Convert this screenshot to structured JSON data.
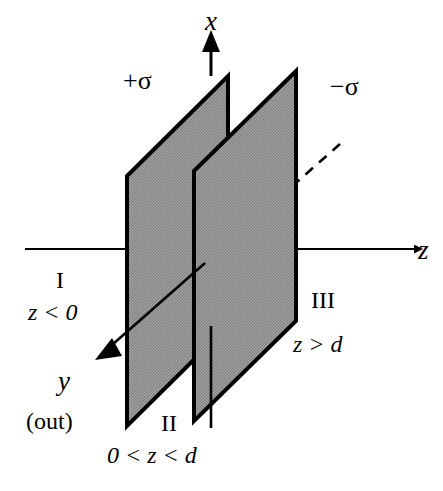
{
  "figure": {
    "background_color": "#ffffff",
    "line_color": "#000000",
    "plane_fill_color": "#999999",
    "width": 443,
    "height": 491
  },
  "axes": {
    "x": {
      "label": "x",
      "direction": "up",
      "label_x": 205,
      "label_y": 8
    },
    "y": {
      "label": "y",
      "direction": "down-left-out-of-page",
      "label_x": 58,
      "label_y": 368
    },
    "z": {
      "label": "z",
      "direction": "right",
      "label_x": 418,
      "label_y": 237
    },
    "y_note": "(out)"
  },
  "planes": [
    {
      "id": "plane-positive",
      "charge_label": "+σ",
      "charge_sign": "positive",
      "position": "z = 0",
      "label_x": 123,
      "label_y": 68
    },
    {
      "id": "plane-negative",
      "charge_label": "−σ",
      "charge_sign": "negative",
      "position": "z = d",
      "label_x": 330,
      "label_y": 74
    }
  ],
  "regions": [
    {
      "id": "region-I",
      "numeral": "I",
      "condition": "z < 0",
      "numeral_x": 56,
      "numeral_y": 268,
      "condition_x": 28,
      "condition_y": 300
    },
    {
      "id": "region-II",
      "numeral": "II",
      "condition": "0 < z < d",
      "numeral_x": 161,
      "numeral_y": 411,
      "condition_x": 107,
      "condition_y": 443
    },
    {
      "id": "region-III",
      "numeral": "III",
      "condition": "z > d",
      "numeral_x": 311,
      "numeral_y": 288,
      "condition_x": 293,
      "condition_y": 332
    }
  ],
  "geometry": {
    "plane1": {
      "points": "127,176 228,76 228,326 127,426"
    },
    "plane2": {
      "points": "194,171 296,71 296,321 194,421"
    },
    "x_axis": {
      "x": 211,
      "top": 36,
      "bottom": 428
    },
    "z_axis": {
      "y": 249,
      "left": 25,
      "right": 415
    },
    "y_axis": {
      "x1": 340,
      "y1": 144,
      "x2": 100,
      "y2": 356
    }
  }
}
